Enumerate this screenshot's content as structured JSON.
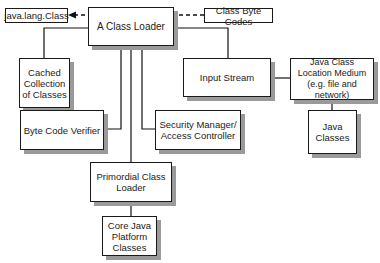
{
  "diagram": {
    "nodes": {
      "java_lang_class": "java.lang.Class",
      "class_loader": "A Class Loader",
      "class_byte_codes": "Class Byte Codes",
      "cached_collection": "Cached\nCollection\nof Classes",
      "input_stream": "Input Stream",
      "location_medium": "Java Class\nLocation Medium\n(e.g. file and network)",
      "java_classes": "Java\nClasses",
      "byte_code_verifier": "Byte Code Verifier",
      "security_manager": "Security Manager/\nAccess Controller",
      "primordial_loader": "Primordial Class\nLoader",
      "core_platform": "Core Java\nPlatform\nClasses"
    },
    "edges": [
      {
        "from": "class_byte_codes",
        "to": "java_lang_class",
        "style": "dashed-arrow"
      },
      {
        "from": "class_loader",
        "to": "cached_collection",
        "style": "solid"
      },
      {
        "from": "class_loader",
        "to": "input_stream",
        "style": "solid"
      },
      {
        "from": "input_stream",
        "to": "location_medium",
        "style": "solid"
      },
      {
        "from": "location_medium",
        "to": "java_classes",
        "style": "solid"
      },
      {
        "from": "class_loader",
        "to": "byte_code_verifier",
        "style": "solid"
      },
      {
        "from": "class_loader",
        "to": "security_manager",
        "style": "solid"
      },
      {
        "from": "class_loader",
        "to": "primordial_loader",
        "style": "solid"
      },
      {
        "from": "primordial_loader",
        "to": "core_platform",
        "style": "solid"
      }
    ]
  }
}
